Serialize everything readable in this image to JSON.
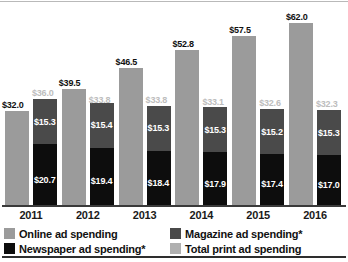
{
  "chart_data": {
    "type": "bar",
    "title": "",
    "subtitle": "",
    "xlabel": "",
    "ylabel": "",
    "categories": [
      "2011",
      "2012",
      "2013",
      "2014",
      "2015",
      "2016"
    ],
    "ylim": [
      0,
      62
    ],
    "grid": false,
    "legend_position": "bottom",
    "stacked_series_note": "Total print ad spending bar is stacked: Newspaper (bottom) + Magazine (top)",
    "series": [
      {
        "name": "Online ad spending",
        "color": "#9b9b9b",
        "values": [
          32.0,
          39.5,
          46.5,
          52.8,
          57.5,
          62.0
        ],
        "labels": [
          "$32.0",
          "$39.5",
          "$46.5",
          "$52.8",
          "$57.5",
          "$62.0"
        ]
      },
      {
        "name": "Total print ad spending",
        "color": "#b0b0b0",
        "values": [
          36.0,
          33.8,
          33.8,
          33.1,
          32.6,
          32.3
        ],
        "labels": [
          "$36.0",
          "$33.8",
          "$33.8",
          "$33.1",
          "$32.6",
          "$32.3"
        ]
      },
      {
        "name": "Magazine ad spending*",
        "color": "#4a4a4a",
        "values": [
          15.3,
          15.4,
          15.3,
          15.3,
          15.2,
          15.3
        ],
        "labels": [
          "$15.3",
          "$15.4",
          "$15.3",
          "$15.3",
          "$15.2",
          "$15.3"
        ]
      },
      {
        "name": "Newspaper ad spending*",
        "color": "#0d0d0d",
        "values": [
          20.7,
          19.4,
          18.4,
          17.9,
          17.4,
          17.0
        ],
        "labels": [
          "$20.7",
          "$19.4",
          "$18.4",
          "$17.9",
          "$17.4",
          "$17.0"
        ]
      }
    ]
  },
  "axis": {
    "ticks": [
      "2011",
      "2012",
      "2013",
      "2014",
      "2015",
      "2016"
    ]
  },
  "legend": {
    "items": [
      {
        "label": "Online ad spending",
        "color": "#9b9b9b"
      },
      {
        "label": "Newspaper ad spending*",
        "color": "#0d0d0d"
      },
      {
        "label": "Magazine ad spending*",
        "color": "#4a4a4a"
      },
      {
        "label": "Total print ad spending",
        "color": "#b0b0b0"
      }
    ]
  }
}
